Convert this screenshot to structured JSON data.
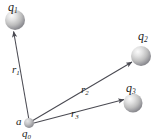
{
  "figure": {
    "background_color": "#ffffff",
    "line_color": "#4a4a52",
    "label_color": "#1c1c1c",
    "sphere_fill_light": "#f2f2f2",
    "sphere_fill_mid": "#c9c9c9",
    "sphere_fill_dark": "#8e8e92"
  },
  "charges": [
    {
      "id": "q1",
      "label": "q",
      "subscript": "1",
      "cx": 15,
      "cy": 20,
      "r": 10
    },
    {
      "id": "q2",
      "label": "q",
      "subscript": "2",
      "cx": 141,
      "cy": 56,
      "r": 10
    },
    {
      "id": "q3",
      "label": "q",
      "subscript": "3",
      "cx": 133,
      "cy": 103,
      "r": 9.5
    },
    {
      "id": "q0",
      "label": "q",
      "subscript": "0",
      "cx": 29,
      "cy": 123,
      "r": 5
    }
  ],
  "point_label": {
    "id": "a",
    "label": "a"
  },
  "vectors": [
    {
      "id": "r1",
      "label": "r",
      "subscript": "1",
      "from": "q0",
      "to": "q1",
      "x1": 29,
      "y1": 120,
      "x2": 13,
      "y2": 31
    },
    {
      "id": "r2",
      "label": "r",
      "subscript": "2",
      "from": "q0",
      "to": "q2",
      "x1": 32,
      "y1": 121,
      "x2": 132,
      "y2": 62
    },
    {
      "id": "r3",
      "label": "r",
      "subscript": "3",
      "from": "q0",
      "to": "q3",
      "x1": 34,
      "y1": 123,
      "x2": 124,
      "y2": 99
    }
  ]
}
